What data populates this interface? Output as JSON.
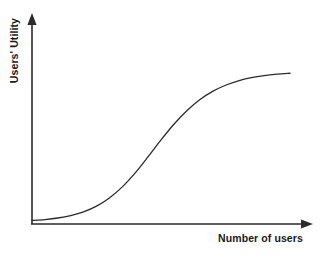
{
  "figure": {
    "background_color": "#ffffff",
    "ink_color": "#2b2b2b",
    "y_axis_label": "Users' Utility",
    "x_axis_label": "Number of users"
  },
  "chart_data": {
    "type": "line",
    "title": "",
    "subtitle": "",
    "xlabel": "Number of users",
    "ylabel": "Users' Utility",
    "xlim": [
      0,
      100
    ],
    "ylim": [
      0,
      100
    ],
    "grid": false,
    "legend": false,
    "legend_position": "none",
    "axis_style": "arrow-headed open axes, no tick marks, no tick labels",
    "annotations": [],
    "series": [
      {
        "name": "Users' Utility",
        "shape": "sigmoid (S-curve) network effect",
        "color": "#2b2b2b",
        "line_width": 1.3,
        "x": [
          0,
          5,
          10,
          15,
          20,
          25,
          30,
          35,
          40,
          45,
          50,
          55,
          60,
          65,
          70,
          75,
          80,
          85,
          90,
          95,
          100
        ],
        "values": [
          1,
          1.6,
          2.6,
          4.2,
          6.6,
          10.3,
          15.6,
          22.8,
          31.9,
          42.4,
          53.3,
          63.5,
          72.3,
          79.4,
          84.8,
          88.8,
          91.7,
          93.7,
          95.1,
          96.0,
          96.6
        ]
      }
    ]
  }
}
